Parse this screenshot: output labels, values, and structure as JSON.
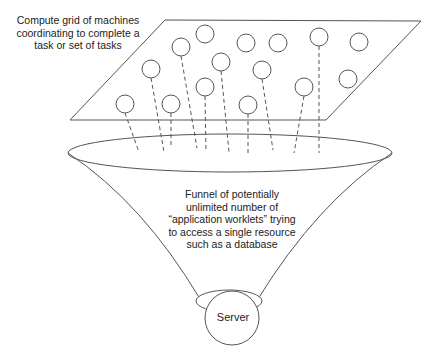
{
  "diagram": {
    "grid_label": [
      "Compute grid of machines",
      "coordinating to complete a",
      "task or set of tasks"
    ],
    "funnel_label": [
      "Funnel of potentially",
      "unlimited number of",
      "“application worklets” trying",
      "to access a single resource",
      "such as a database"
    ],
    "server_label": "Server",
    "colors": {
      "stroke": "#555555",
      "text": "#222222",
      "background": "#ffffff"
    },
    "grid_plane": {
      "points": [
        [
          165,
          20
        ],
        [
          421,
          21
        ],
        [
          326,
          120
        ],
        [
          70,
          120
        ]
      ]
    },
    "machines": [
      {
        "cx": 125,
        "cy": 104,
        "connected": true,
        "line_end": [
          139,
          152
        ]
      },
      {
        "cx": 151,
        "cy": 69,
        "connected": true,
        "line_end": [
          164,
          152
        ]
      },
      {
        "cx": 181,
        "cy": 47,
        "connected": true,
        "line_end": [
          197,
          148
        ]
      },
      {
        "cx": 205,
        "cy": 34,
        "connected": false
      },
      {
        "cx": 171,
        "cy": 104,
        "connected": true,
        "line_end": [
          171,
          146
        ]
      },
      {
        "cx": 205,
        "cy": 87,
        "connected": true,
        "line_end": [
          206,
          152
        ]
      },
      {
        "cx": 221,
        "cy": 62,
        "connected": true,
        "line_end": [
          229,
          152
        ]
      },
      {
        "cx": 246,
        "cy": 43,
        "connected": false
      },
      {
        "cx": 278,
        "cy": 43,
        "connected": false
      },
      {
        "cx": 262,
        "cy": 70,
        "connected": true,
        "line_end": [
          273,
          150
        ]
      },
      {
        "cx": 248,
        "cy": 105,
        "connected": true,
        "line_end": [
          248,
          153
        ]
      },
      {
        "cx": 319,
        "cy": 37,
        "connected": true,
        "line_end": [
          319,
          153
        ]
      },
      {
        "cx": 359,
        "cy": 42,
        "connected": false
      },
      {
        "cx": 304,
        "cy": 87,
        "connected": true,
        "line_end": [
          294,
          153
        ]
      },
      {
        "cx": 348,
        "cy": 79,
        "connected": false
      }
    ],
    "funnel_top": {
      "cx": 230,
      "cy": 153,
      "rx": 162,
      "ry": 19
    },
    "funnel_neck": {
      "cx": 229,
      "cy": 301,
      "rx": 33,
      "ry": 11
    },
    "server": {
      "cx": 232,
      "cy": 318,
      "r": 27
    }
  }
}
